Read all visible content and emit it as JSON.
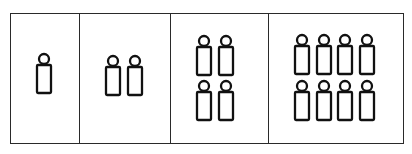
{
  "diagram": {
    "title": "",
    "colors": {
      "stroke": "#111111",
      "background": "#ffffff",
      "frame": "#2a2a2a"
    },
    "panels": [
      {
        "label": "",
        "count": 1,
        "layout": "1x1",
        "figures": [
          {
            "x": 44,
            "y": 59
          }
        ]
      },
      {
        "label": "",
        "count": 2,
        "layout": "2x1",
        "figures": [
          {
            "x": 113,
            "y": 61
          },
          {
            "x": 135,
            "y": 61
          }
        ]
      },
      {
        "label": "",
        "count": 4,
        "layout": "2x2",
        "figures": [
          {
            "x": 204,
            "y": 41
          },
          {
            "x": 226,
            "y": 41
          },
          {
            "x": 204,
            "y": 86
          },
          {
            "x": 226,
            "y": 86
          }
        ]
      },
      {
        "label": "",
        "count": 8,
        "layout": "4x2",
        "figures": [
          {
            "x": 302,
            "y": 40
          },
          {
            "x": 324,
            "y": 40
          },
          {
            "x": 345,
            "y": 40
          },
          {
            "x": 367,
            "y": 40
          },
          {
            "x": 302,
            "y": 86
          },
          {
            "x": 324,
            "y": 86
          },
          {
            "x": 345,
            "y": 86
          },
          {
            "x": 367,
            "y": 86
          }
        ]
      }
    ],
    "figure_icon": "person-icon"
  }
}
